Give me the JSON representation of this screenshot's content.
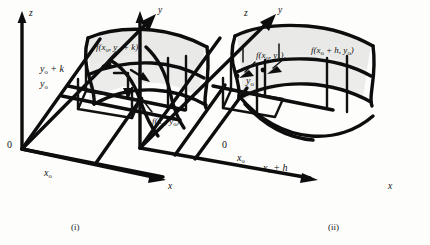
{
  "figure": {
    "background_color": "#fdfdfc",
    "ink_color": "#0d0d0d",
    "surface_fill_color": "#e9e9e7",
    "panels": [
      {
        "id": "i",
        "caption": "(i)",
        "axes": {
          "z": "z",
          "y": "y",
          "x": "x",
          "origin": "0"
        },
        "tick_labels": {
          "x0": "x",
          "x0_sub": "o",
          "y0": "y",
          "y0_sub": "o",
          "y0_plus_k": "y",
          "y0_plus_k_sub": "o",
          "y0_plus_k_tail": " + k"
        },
        "value_labels": [
          {
            "name": "f-x0-y0-plus-k",
            "prefix": "f(x",
            "sub1": "o",
            "mid": ", y",
            "sub2": "o",
            "suffix": " + k)"
          },
          {
            "name": "f-x0-y0",
            "prefix": "f(x",
            "sub1": "o",
            "mid": ", y",
            "sub2": "o",
            "suffix": ")"
          }
        ]
      },
      {
        "id": "ii",
        "caption": "(ii)",
        "axes": {
          "z": "z",
          "y": "y",
          "x": "x",
          "origin": "0"
        },
        "tick_labels": {
          "x0": "x",
          "x0_sub": "o",
          "x0_plus_h": "x",
          "x0_plus_h_sub": "o",
          "x0_plus_h_tail": " + h",
          "y0": "y",
          "y0_sub": "o"
        },
        "value_labels": [
          {
            "name": "f-x0-y0",
            "prefix": "f(x",
            "sub1": "o",
            "mid": ", y",
            "sub2": "o",
            "suffix": ")"
          },
          {
            "name": "f-x0-plus-h-y0",
            "prefix": "f(x",
            "sub1": "o",
            "mid": " + h, y",
            "sub2": "o",
            "suffix": ")"
          }
        ]
      }
    ]
  }
}
